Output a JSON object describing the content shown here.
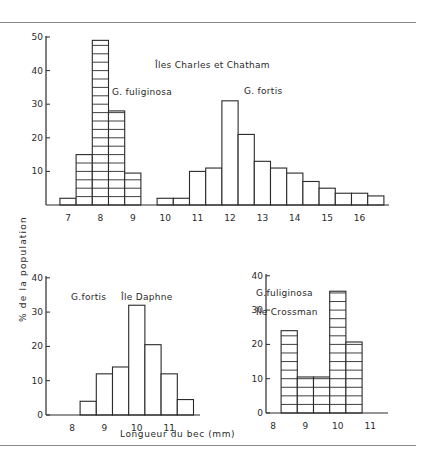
{
  "chart_data": [
    {
      "id": "charles_chatham",
      "type": "bar",
      "title": "Îles Charles et Chatham",
      "xlabel": "",
      "ylabel": "% de la population",
      "ylim": [
        0,
        50
      ],
      "yticks": [
        10,
        20,
        30,
        40,
        50
      ],
      "xticks": [
        7,
        8,
        9,
        10,
        11,
        12,
        13,
        14,
        15,
        16
      ],
      "grid": false,
      "series": [
        {
          "name": "G. fuliginosa",
          "hatched": true,
          "bins": [
            6.75,
            7.25,
            7.75,
            8.25,
            8.75
          ],
          "values": [
            2,
            15,
            49,
            28,
            9.5
          ]
        },
        {
          "name": "G. fortis",
          "hatched": false,
          "bins": [
            9.75,
            10.25,
            10.75,
            11.25,
            11.75,
            12.25,
            12.75,
            13.25,
            13.75,
            14.25,
            14.75,
            15.25,
            15.75,
            16.25
          ],
          "values": [
            2,
            2,
            10,
            11,
            31,
            21,
            13,
            11,
            9.5,
            7,
            5,
            3.5,
            3.5,
            2.7
          ]
        }
      ]
    },
    {
      "id": "daphne",
      "type": "bar",
      "title": "Île Daphne",
      "xlabel": "Longueur du bec (mm)",
      "ylabel": "% de la population",
      "ylim": [
        0,
        40
      ],
      "yticks": [
        0,
        10,
        20,
        30,
        40
      ],
      "xticks": [
        8,
        9,
        10,
        11
      ],
      "grid": false,
      "series": [
        {
          "name": "G. fortis",
          "hatched": false,
          "bins": [
            8.25,
            8.75,
            9.25,
            9.75,
            10.25,
            10.75,
            11.25
          ],
          "values": [
            4,
            12,
            14,
            32,
            20.5,
            12,
            4.5
          ]
        }
      ]
    },
    {
      "id": "crossman",
      "type": "bar",
      "title": "Île Crossman",
      "xlabel": "",
      "ylabel": "",
      "ylim": [
        0,
        40
      ],
      "yticks": [
        0,
        10,
        20,
        30,
        40
      ],
      "xticks": [
        8,
        9,
        10,
        11
      ],
      "grid": false,
      "series": [
        {
          "name": "G. fuliginosa",
          "hatched": true,
          "bins": [
            8.25,
            8.75,
            9.25,
            9.75,
            10.25
          ],
          "values": [
            24,
            10.5,
            10.5,
            35.5,
            20.7
          ]
        }
      ]
    }
  ],
  "labels": {
    "top_title": "Îles Charles et Chatham",
    "top_fuliginosa": "G. fuliginosa",
    "top_fortis": "G. fortis",
    "ylabel": "% de la population",
    "daphne_species": "G.fortis",
    "daphne_island": "Île Daphne",
    "crossman_species": "G.fuliginosa",
    "crossman_island": "Île Crossman",
    "xlabel": "Longueur du bec (mm)"
  }
}
